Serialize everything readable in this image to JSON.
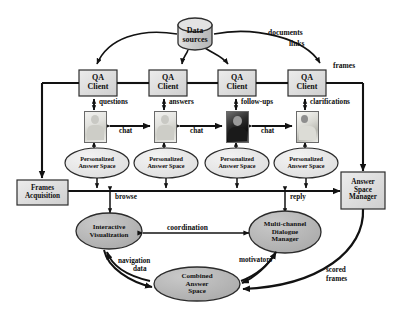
{
  "figure": {
    "type": "flow-diagram"
  },
  "nodes": {
    "data_sources": {
      "label_line1": "Data",
      "label_line2": "sources",
      "shape": "cylinder",
      "fill": "#d4d4d4"
    },
    "qa_clients": [
      {
        "label_line1": "QA",
        "label_line2": "Client"
      },
      {
        "label_line1": "QA",
        "label_line2": "Client"
      },
      {
        "label_line1": "QA",
        "label_line2": "Client"
      },
      {
        "label_line1": "QA",
        "label_line2": "Client"
      }
    ],
    "personalized_spaces": [
      {
        "label_line1": "Personalized",
        "label_line2": "Answer Space"
      },
      {
        "label_line1": "Personalized",
        "label_line2": "Answer Space"
      },
      {
        "label_line1": "Personalized",
        "label_line2": "Answer Space"
      },
      {
        "label_line1": "Personalized",
        "label_line2": "Answer Space"
      }
    ],
    "frames_acquisition": {
      "label_line1": "Frames",
      "label_line2": "Acquisition"
    },
    "answer_space_manager": {
      "label_line1": "Answer",
      "label_line2": "Space",
      "label_line3": "Manager"
    },
    "interactive_visualization": {
      "label_line1": "Interactive",
      "label_line2": "Visualization"
    },
    "dialogue_manager": {
      "label_line1": "Multi-channel",
      "label_line2": "Dialogue",
      "label_line3": "Manager"
    },
    "combined_answer_space": {
      "label_line1": "Combined",
      "label_line2": "Answer",
      "label_line3": "Space"
    }
  },
  "edge_labels": {
    "documents": "documents",
    "links": "links",
    "frames": "frames",
    "questions": "questions",
    "answers": "answers",
    "follow_ups": "follow-ups",
    "clarifications": "clarifications",
    "chat1": "chat",
    "chat2": "chat",
    "chat3": "chat",
    "browse": "browse",
    "reply": "reply",
    "coordination": "coordination",
    "navigation": "navigation",
    "data": "data",
    "motivators": "motivators",
    "scored": "scored",
    "scored_frames": "frames"
  },
  "colors": {
    "box_fill": "#dcdcdc",
    "box_stroke": "#3a3a3a",
    "ellipse_fill_light": "#e6e6e6",
    "ellipse_fill_dark": "#b5b5b5",
    "cylinder_fill": "#cfcfcf",
    "line": "#121212",
    "text": "#0d0d0d"
  }
}
